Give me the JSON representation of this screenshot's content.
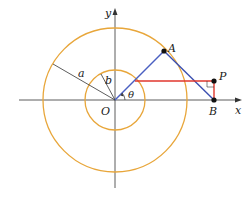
{
  "diagram": {
    "type": "geometry",
    "labels": {
      "x_axis": "x",
      "y_axis": "y",
      "origin": "O",
      "point_a": "A",
      "point_b": "B",
      "point_p": "P",
      "outer_radius": "a",
      "inner_radius": "b",
      "angle": "θ"
    },
    "colors": {
      "circles": "#e8a63a",
      "segment_blue": "#4a5fc1",
      "segment_red": "#e0362c",
      "axes": "#333333"
    }
  }
}
